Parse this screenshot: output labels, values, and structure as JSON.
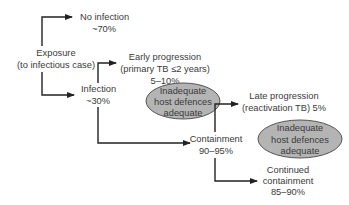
{
  "diagram": {
    "colors": {
      "ellipse_fill": "#b4b4b4",
      "ellipse_stroke": "#555555",
      "line": "#222222",
      "text": "#3a3a3a"
    },
    "nodes": {
      "exposure": {
        "line1": "Exposure",
        "line2": "(to infectious case)"
      },
      "no_infection": {
        "line1": "No infection",
        "line2": "~70%"
      },
      "infection": {
        "line1": "Infection",
        "line2": "~30%"
      },
      "early_progression": {
        "line1": "Early progression",
        "line2": "(primary TB ≤2 years)",
        "line3": "5–10%"
      },
      "host_defences_1": {
        "line1": "Inadequate",
        "line2": "host defences",
        "line3": "adequate"
      },
      "containment": {
        "line1": "Containment",
        "line2": "90–95%"
      },
      "late_progression": {
        "line1": "Late progression",
        "line2": "(reactivation TB) 5%"
      },
      "host_defences_2": {
        "line1": "Inadequate",
        "line2": "host defences",
        "line3": "adequate"
      },
      "continued_containment": {
        "line1": "Continued",
        "line2": "containment",
        "line3": "85–90%"
      }
    }
  }
}
